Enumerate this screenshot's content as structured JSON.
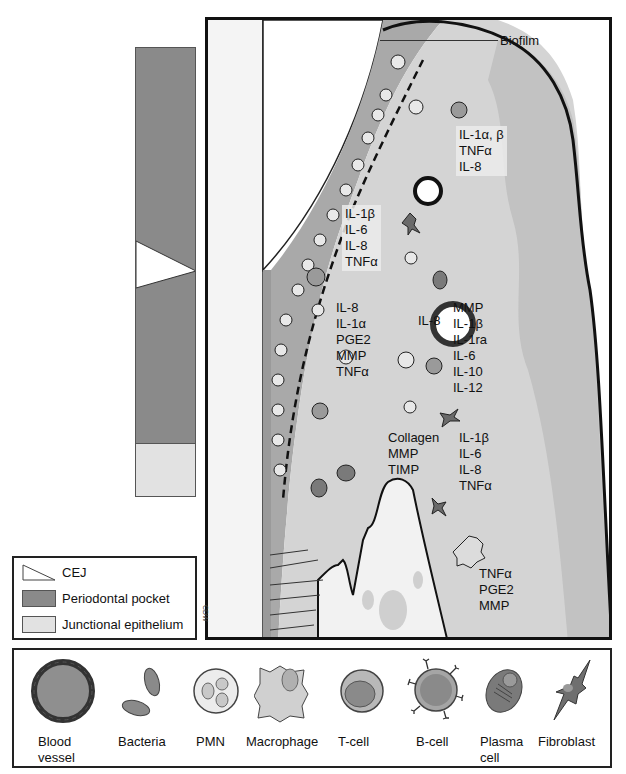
{
  "diagram": {
    "title_label": "Biofilm",
    "signature": "CDW",
    "depth_bar": {
      "segments": [
        {
          "name": "Periodontal pocket",
          "color": "#8a8a8a"
        },
        {
          "name": "CEJ",
          "color": "#ffffff"
        },
        {
          "name": "Junctional epithelium",
          "color": "#e2e2e2"
        }
      ]
    },
    "cytokine_groups": [
      {
        "id": "gingival-epithelium-top",
        "lines": [
          "IL-1α, β",
          "TNFα",
          "IL-8"
        ]
      },
      {
        "id": "pocket-epithelium-upper",
        "lines": [
          "IL-1β",
          "IL-6",
          "IL-8",
          "TNFα"
        ]
      },
      {
        "id": "pocket-epithelium-lower",
        "lines": [
          "IL-8",
          "IL-1α",
          "PGE2",
          "MMP",
          "TNFα"
        ]
      },
      {
        "id": "blood-vessel-label",
        "lines": [
          "IL-8"
        ]
      },
      {
        "id": "connective-tissue-mid",
        "lines": [
          "MMP",
          "IL-1β",
          "IL-1ra",
          "IL-6",
          "IL-10",
          "IL-12"
        ]
      },
      {
        "id": "fibroblast-matrix",
        "lines": [
          "Collagen",
          "MMP",
          "TIMP"
        ]
      },
      {
        "id": "fibroblast-cytokines",
        "lines": [
          "IL-1β",
          "IL-6",
          "IL-8",
          "TNFα"
        ]
      },
      {
        "id": "macrophage-bone",
        "lines": [
          "TNFα",
          "PGE2",
          "MMP"
        ]
      }
    ]
  },
  "legend_small": {
    "items": [
      {
        "label": "CEJ",
        "swatch": "triangle"
      },
      {
        "label": "Periodontal pocket",
        "color": "#8a8a8a"
      },
      {
        "label": "Junctional epithelium",
        "color": "#e2e2e2"
      }
    ]
  },
  "legend_cells": {
    "items": [
      {
        "label": "Blood vessel",
        "lines": [
          "Blood",
          "vessel"
        ]
      },
      {
        "label": "Bacteria",
        "lines": [
          "Bacteria"
        ]
      },
      {
        "label": "PMN",
        "lines": [
          "PMN"
        ]
      },
      {
        "label": "Macrophage",
        "lines": [
          "Macrophage"
        ]
      },
      {
        "label": "T-cell",
        "lines": [
          "T-cell"
        ]
      },
      {
        "label": "B-cell",
        "lines": [
          "B-cell"
        ]
      },
      {
        "label": "Plasma cell",
        "lines": [
          "Plasma",
          "cell"
        ]
      },
      {
        "label": "Fibroblast",
        "lines": [
          "Fibroblast"
        ]
      }
    ]
  },
  "colors": {
    "pocket": "#8a8a8a",
    "junctional": "#e2e2e2",
    "tissue": "#c9c9c9",
    "outline": "#111111"
  }
}
